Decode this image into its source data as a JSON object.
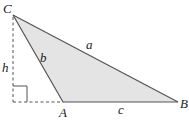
{
  "diagram": {
    "type": "triangle-with-altitude",
    "colors": {
      "fill": "#e4e4e4",
      "stroke": "#555555",
      "dashed": "#555555",
      "text": "#222222"
    },
    "vertices": {
      "C": {
        "label": "C",
        "x": 13,
        "y": 15
      },
      "A": {
        "label": "A",
        "x": 63,
        "y": 102
      },
      "B": {
        "label": "B",
        "x": 178,
        "y": 102
      }
    },
    "foot": {
      "x": 13,
      "y": 102
    },
    "sides": {
      "a": {
        "label": "a"
      },
      "b": {
        "label": "b"
      },
      "c": {
        "label": "c"
      }
    },
    "altitude": {
      "label": "h"
    }
  }
}
